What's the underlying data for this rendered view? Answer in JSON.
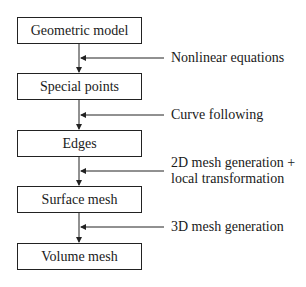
{
  "diagram": {
    "type": "flowchart",
    "nodes": [
      {
        "id": "n1",
        "label": "Geometric model"
      },
      {
        "id": "n2",
        "label": "Special points"
      },
      {
        "id": "n3",
        "label": "Edges"
      },
      {
        "id": "n4",
        "label": "Surface mesh"
      },
      {
        "id": "n5",
        "label": "Volume mesh"
      }
    ],
    "edges": [
      {
        "from": "n1",
        "to": "n2",
        "label_line1": "Nonlinear equations",
        "label_line2": ""
      },
      {
        "from": "n2",
        "to": "n3",
        "label_line1": "Curve following",
        "label_line2": ""
      },
      {
        "from": "n3",
        "to": "n4",
        "label_line1": "2D mesh generation +",
        "label_line2": "local transformation"
      },
      {
        "from": "n4",
        "to": "n5",
        "label_line1": "3D mesh generation",
        "label_line2": ""
      }
    ],
    "colors": {
      "stroke": "#222222",
      "background": "#ffffff"
    }
  }
}
